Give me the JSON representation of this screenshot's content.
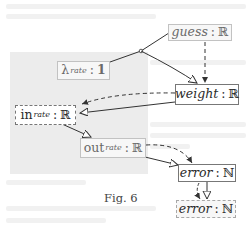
{
  "figure": {
    "caption": "Fig. 6",
    "nodes": {
      "guess": {
        "name": "guess",
        "sep": ":",
        "type": "ℝ",
        "style": "faint"
      },
      "lambda": {
        "name": "λ",
        "sup": "rate",
        "sep": ":",
        "type": "1",
        "style": "faint"
      },
      "weight": {
        "name": "weight",
        "sep": ":",
        "type": "ℝ",
        "style": "solid"
      },
      "in": {
        "name": "in",
        "sup": "rate",
        "sep": ":",
        "type": "ℝ",
        "style": "dashed"
      },
      "out": {
        "name": "out",
        "sup": "rate",
        "sep": ":",
        "type": "ℝ",
        "style": "faint"
      },
      "error": {
        "name": "error",
        "sep": ":",
        "type": "ℕ",
        "style": "solid"
      },
      "error_copy": {
        "name": "error",
        "sep": ":",
        "type": "ℕ",
        "style": "dashed"
      }
    },
    "edges": [
      {
        "from": "guess",
        "to": "weight",
        "kind": "solid-merge-via-lambda",
        "arrow": "hollow-triangle"
      },
      {
        "from": "lambda",
        "to": "weight",
        "kind": "solid",
        "arrow": "hollow-triangle"
      },
      {
        "from": "guess",
        "to": "weight",
        "kind": "dashed",
        "arrow": "filled"
      },
      {
        "from": "weight",
        "to": "in",
        "kind": "dashed",
        "arrow": "filled"
      },
      {
        "from": "weight",
        "to": "in",
        "kind": "solid",
        "arrow": "hollow-triangle"
      },
      {
        "from": "in",
        "to": "out",
        "kind": "solid",
        "arrow": "hollow-triangle"
      },
      {
        "from": "out",
        "to": "error",
        "kind": "dashed",
        "arrow": "filled"
      },
      {
        "from": "out",
        "to": "error",
        "kind": "solid",
        "arrow": "hollow-triangle"
      },
      {
        "from": "error",
        "to": "error_copy",
        "kind": "dashed",
        "arrow": "filled"
      },
      {
        "from": "error",
        "to": "error_copy",
        "kind": "solid",
        "arrow": "hollow-triangle"
      }
    ],
    "colors": {
      "region": "#ececec",
      "line": "#333333",
      "faint_border": "#c2c2c2"
    }
  }
}
